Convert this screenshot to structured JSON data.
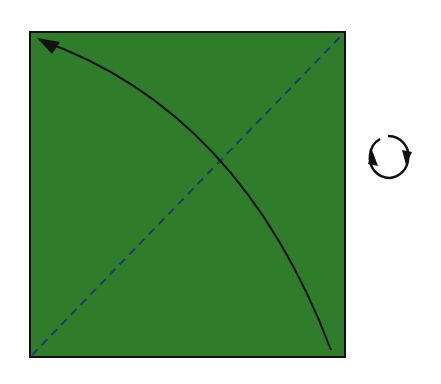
{
  "diagram": {
    "type": "origami-step",
    "square": {
      "x": 30,
      "y": 32,
      "size": 315,
      "fill": "#2f7d2a",
      "stroke": "#111111"
    },
    "diagonal_fold_line": {
      "style": "dashed",
      "color": "#1f3a6b",
      "from": "bottom-left",
      "to": "top-right"
    },
    "fold_arrow": {
      "color": "#111111",
      "from": "bottom-right",
      "to": "top-left"
    },
    "turn_over_symbol": {
      "color": "#111111",
      "meaning": "turn-over"
    }
  }
}
